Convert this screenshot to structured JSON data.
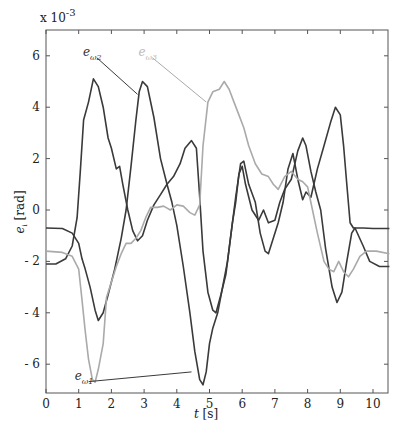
{
  "chart_data": {
    "type": "line",
    "title": "",
    "xlabel": "t [s]",
    "xlabel_var": "t",
    "xlabel_unit": "[s]",
    "ylabel": "e_i [rad]",
    "ylabel_var": "e",
    "ylabel_sub": "i",
    "ylabel_unit": "[rad]",
    "y_multiplier": "x 10",
    "y_exponent": "-3",
    "xlim": [
      0,
      10.5
    ],
    "ylim": [
      -7,
      7
    ],
    "xticks": [
      0,
      1,
      2,
      3,
      4,
      5,
      6,
      7,
      8,
      9,
      10
    ],
    "yticks": [
      -6,
      -4,
      -2,
      0,
      2,
      4,
      6
    ],
    "grid": false,
    "legend": "inline annotations",
    "series": [
      {
        "name": "e_ω1",
        "label_main": "e",
        "label_sub": "ω1",
        "color": "#3a3a3a",
        "label_pos": [
          1.0,
          -6.6
        ],
        "arrow_to": [
          4.45,
          -6.3
        ],
        "points": [
          [
            0,
            -0.7
          ],
          [
            0.5,
            -0.72
          ],
          [
            0.8,
            -0.9
          ],
          [
            1.0,
            -1.3
          ],
          [
            1.1,
            -1.9
          ],
          [
            1.2,
            -2.3
          ],
          [
            1.35,
            -3.0
          ],
          [
            1.5,
            -3.9
          ],
          [
            1.6,
            -4.3
          ],
          [
            1.75,
            -4.0
          ],
          [
            1.9,
            -3.3
          ],
          [
            2.1,
            -2.3
          ],
          [
            2.3,
            -1.1
          ],
          [
            2.45,
            0.0
          ],
          [
            2.6,
            1.7
          ],
          [
            2.75,
            3.5
          ],
          [
            2.85,
            4.6
          ],
          [
            2.95,
            5.0
          ],
          [
            3.1,
            4.8
          ],
          [
            3.3,
            3.6
          ],
          [
            3.5,
            2.0
          ],
          [
            3.7,
            1.0
          ],
          [
            3.85,
            0.3
          ],
          [
            4.0,
            -0.6
          ],
          [
            4.2,
            -2.2
          ],
          [
            4.4,
            -4.0
          ],
          [
            4.55,
            -5.5
          ],
          [
            4.7,
            -6.6
          ],
          [
            4.8,
            -6.8
          ],
          [
            4.9,
            -6.3
          ],
          [
            5.0,
            -5.2
          ],
          [
            5.1,
            -4.6
          ],
          [
            5.25,
            -4.0
          ],
          [
            5.4,
            -3.0
          ],
          [
            5.55,
            -2.0
          ],
          [
            5.7,
            -0.5
          ],
          [
            5.8,
            0.3
          ],
          [
            5.9,
            1.4
          ],
          [
            6.0,
            1.7
          ],
          [
            6.1,
            1.0
          ],
          [
            6.3,
            0.0
          ],
          [
            6.5,
            -0.4
          ],
          [
            6.65,
            0.0
          ],
          [
            6.8,
            -0.5
          ],
          [
            7.0,
            -0.4
          ],
          [
            7.15,
            0.3
          ],
          [
            7.3,
            0.8
          ],
          [
            7.5,
            1.2
          ],
          [
            7.7,
            2.3
          ],
          [
            7.85,
            2.8
          ],
          [
            7.95,
            2.5
          ],
          [
            8.1,
            1.5
          ],
          [
            8.25,
            0.7
          ],
          [
            8.4,
            0.0
          ],
          [
            8.55,
            -1.5
          ],
          [
            8.75,
            -3.0
          ],
          [
            8.9,
            -3.6
          ],
          [
            9.05,
            -3.2
          ],
          [
            9.2,
            -2.0
          ],
          [
            9.35,
            -0.9
          ],
          [
            9.45,
            -0.7
          ],
          [
            9.7,
            -1.4
          ],
          [
            9.9,
            -2.0
          ],
          [
            10.2,
            -2.2
          ],
          [
            10.5,
            -2.2
          ]
        ]
      },
      {
        "name": "e_ω2",
        "label_main": "e",
        "label_sub": "ω2",
        "color": "#3a3a3a",
        "label_pos": [
          1.25,
          6.0
        ],
        "arrow_to": [
          2.8,
          4.5
        ],
        "points": [
          [
            0,
            -2.1
          ],
          [
            0.3,
            -2.1
          ],
          [
            0.6,
            -1.9
          ],
          [
            0.8,
            -1.4
          ],
          [
            0.95,
            -0.3
          ],
          [
            1.05,
            1.5
          ],
          [
            1.15,
            3.5
          ],
          [
            1.3,
            4.2
          ],
          [
            1.45,
            5.1
          ],
          [
            1.6,
            4.8
          ],
          [
            1.75,
            4.0
          ],
          [
            1.9,
            2.8
          ],
          [
            2.0,
            2.4
          ],
          [
            2.15,
            1.6
          ],
          [
            2.25,
            1.7
          ],
          [
            2.35,
            1.0
          ],
          [
            2.5,
            0.0
          ],
          [
            2.65,
            -0.8
          ],
          [
            2.8,
            -1.2
          ],
          [
            2.95,
            -1.0
          ],
          [
            3.1,
            -0.4
          ],
          [
            3.3,
            0.2
          ],
          [
            3.5,
            0.6
          ],
          [
            3.7,
            1.0
          ],
          [
            3.9,
            1.3
          ],
          [
            4.1,
            1.8
          ],
          [
            4.25,
            2.4
          ],
          [
            4.45,
            2.7
          ],
          [
            4.6,
            2.4
          ],
          [
            4.7,
            0.5
          ],
          [
            4.8,
            -1.6
          ],
          [
            4.95,
            -3.2
          ],
          [
            5.1,
            -3.9
          ],
          [
            5.2,
            -4.0
          ],
          [
            5.35,
            -3.3
          ],
          [
            5.5,
            -2.5
          ],
          [
            5.65,
            -1.0
          ],
          [
            5.8,
            0.5
          ],
          [
            5.95,
            1.8
          ],
          [
            6.05,
            1.9
          ],
          [
            6.2,
            1.0
          ],
          [
            6.4,
            0.3
          ],
          [
            6.55,
            -0.9
          ],
          [
            6.7,
            -1.6
          ],
          [
            6.8,
            -1.7
          ],
          [
            6.95,
            -1.1
          ],
          [
            7.1,
            -0.5
          ],
          [
            7.25,
            0.3
          ],
          [
            7.4,
            1.6
          ],
          [
            7.55,
            2.2
          ],
          [
            7.7,
            1.2
          ],
          [
            7.85,
            0.4
          ],
          [
            7.95,
            0.7
          ],
          [
            8.1,
            0.5
          ],
          [
            8.3,
            1.6
          ],
          [
            8.5,
            2.5
          ],
          [
            8.7,
            3.4
          ],
          [
            8.85,
            4.0
          ],
          [
            9.0,
            3.7
          ],
          [
            9.1,
            2.5
          ],
          [
            9.2,
            1.0
          ],
          [
            9.3,
            -0.5
          ],
          [
            9.4,
            -0.7
          ],
          [
            9.7,
            -0.7
          ],
          [
            10.0,
            -0.72
          ],
          [
            10.5,
            -0.72
          ]
        ]
      },
      {
        "name": "e_ω3",
        "label_main": "e",
        "label_sub": "ω3",
        "color": "#aaaaaa",
        "label_pos": [
          2.95,
          6.0
        ],
        "arrow_to": [
          4.9,
          4.2
        ],
        "points": [
          [
            0,
            -1.6
          ],
          [
            0.5,
            -1.65
          ],
          [
            0.8,
            -1.8
          ],
          [
            1.0,
            -2.3
          ],
          [
            1.1,
            -3.5
          ],
          [
            1.2,
            -4.7
          ],
          [
            1.3,
            -5.8
          ],
          [
            1.42,
            -6.6
          ],
          [
            1.5,
            -6.7
          ],
          [
            1.6,
            -6.2
          ],
          [
            1.75,
            -5.2
          ],
          [
            1.85,
            -3.4
          ],
          [
            2.0,
            -2.8
          ],
          [
            2.15,
            -2.2
          ],
          [
            2.3,
            -1.7
          ],
          [
            2.45,
            -1.3
          ],
          [
            2.6,
            -1.3
          ],
          [
            2.75,
            -1.1
          ],
          [
            2.9,
            -0.8
          ],
          [
            3.05,
            -0.3
          ],
          [
            3.2,
            0.1
          ],
          [
            3.4,
            0.1
          ],
          [
            3.6,
            0.15
          ],
          [
            3.8,
            0.0
          ],
          [
            4.0,
            0.2
          ],
          [
            4.2,
            0.15
          ],
          [
            4.4,
            -0.1
          ],
          [
            4.55,
            -0.2
          ],
          [
            4.7,
            0.2
          ],
          [
            4.8,
            2.5
          ],
          [
            4.95,
            4.2
          ],
          [
            5.1,
            4.6
          ],
          [
            5.3,
            4.7
          ],
          [
            5.45,
            5.0
          ],
          [
            5.6,
            4.7
          ],
          [
            5.75,
            4.2
          ],
          [
            5.9,
            3.7
          ],
          [
            6.05,
            3.2
          ],
          [
            6.2,
            2.5
          ],
          [
            6.4,
            1.8
          ],
          [
            6.6,
            1.4
          ],
          [
            6.8,
            1.3
          ],
          [
            6.95,
            1.0
          ],
          [
            7.1,
            0.8
          ],
          [
            7.3,
            1.3
          ],
          [
            7.5,
            1.5
          ],
          [
            7.7,
            1.2
          ],
          [
            7.85,
            1.1
          ],
          [
            8.0,
            0.9
          ],
          [
            8.15,
            0.0
          ],
          [
            8.3,
            -0.9
          ],
          [
            8.5,
            -2.0
          ],
          [
            8.65,
            -2.3
          ],
          [
            8.8,
            -2.4
          ],
          [
            8.95,
            -2.0
          ],
          [
            9.1,
            -2.4
          ],
          [
            9.25,
            -2.6
          ],
          [
            9.4,
            -2.3
          ],
          [
            9.6,
            -1.8
          ],
          [
            9.8,
            -1.6
          ],
          [
            10.1,
            -1.6
          ],
          [
            10.5,
            -1.7
          ]
        ]
      }
    ]
  }
}
